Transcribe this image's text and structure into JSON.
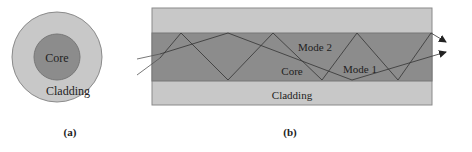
{
  "colors": {
    "cladding": "#c8c8c8",
    "core": "#8c8c8c",
    "outline": "#7a7a7a",
    "ray": "#444444",
    "text": "#222222"
  },
  "panel_a": {
    "core_label": "Core",
    "cladding_label": "Cladding",
    "caption": "(a)"
  },
  "panel_b": {
    "mode2_label": "Mode 2",
    "mode1_label": "Mode 1",
    "core_label": "Core",
    "cladding_label": "Cladding",
    "caption": "(b)"
  }
}
